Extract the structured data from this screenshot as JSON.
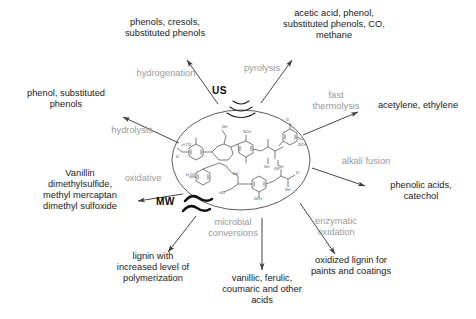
{
  "diagram": {
    "center": {
      "label": "lignin-structure",
      "description": "lignin macromolecule structural formula"
    },
    "energy_sources": [
      {
        "id": "us",
        "label": "US",
        "name": "ultrasound",
        "icon": "sound-wave-arcs-icon"
      },
      {
        "id": "mw",
        "label": "MW",
        "name": "microwave",
        "icon": "wavy-lines-icon"
      }
    ],
    "pathways": [
      {
        "id": "hydrogenation",
        "process": "hydrogenation",
        "product": "phenols, cresols,\nsubstituted phenols"
      },
      {
        "id": "pyrolysis",
        "process": "pyrolysis",
        "product": "acetic acid, phenol,\nsubstituted phenols, CO,\nmethane"
      },
      {
        "id": "fast-thermolysis",
        "process": "fast\nthermolysis",
        "product": "acetylene, ethylene"
      },
      {
        "id": "alkali-fusion",
        "process": "alkali fusion",
        "product": "phenolic acids,\ncatechol"
      },
      {
        "id": "enzymatic-oxidation",
        "process": "enzymatic\noxidation",
        "product": "oxidized lignin for\npaints and coatings"
      },
      {
        "id": "microbial-conversions",
        "process": "microbial\nconversions",
        "product": "vanillic, ferulic,\ncoumaric and other\nacids"
      },
      {
        "id": "oxidative",
        "process": "oxidative",
        "product": "Vanillin\ndimethylsulfide,\nmethyl mercaptan\ndimethyl sulfoxide"
      },
      {
        "id": "polymerization",
        "process": "",
        "product": "lignin with\nincreased level of\npolymerization"
      },
      {
        "id": "hydrolysis",
        "process": "hydrolysis",
        "product": "phenol, substituted\nphenols"
      }
    ],
    "colors": {
      "process_label": "#9a9a9a",
      "product_label": "#1b1b1b",
      "arrow": "#3c3c3c",
      "structure": "#2b2b2b",
      "background": "#ffffff"
    }
  }
}
